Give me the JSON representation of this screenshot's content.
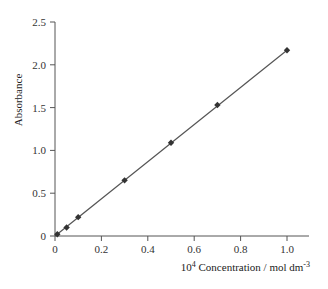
{
  "chart_data": {
    "type": "scatter",
    "title": "",
    "xlabel": "10^4 Concentration / mol dm^-3",
    "xlabel_parts": {
      "prefix": "10",
      "exp": "4",
      "main": " Concentration / mol dm",
      "unit_exp": "-3"
    },
    "ylabel": "Absorbance",
    "xlim": [
      0,
      1.1
    ],
    "ylim": [
      0,
      2.5
    ],
    "x_ticks": [
      0,
      0.2,
      0.4,
      0.6,
      0.8,
      1.0
    ],
    "x_tick_labels": [
      "0",
      "0.2",
      "0.4",
      "0.6",
      "0.8",
      "1.0"
    ],
    "y_ticks": [
      0,
      0.5,
      1.0,
      1.5,
      2.0,
      2.5
    ],
    "y_tick_labels": [
      "0",
      "0.5",
      "1.0",
      "1.5",
      "2.0",
      "2.5"
    ],
    "grid": false,
    "legend": null,
    "series": [
      {
        "name": "data",
        "marker": "diamond",
        "color": "#333333",
        "x": [
          0.01,
          0.05,
          0.1,
          0.3,
          0.5,
          0.7,
          1.0
        ],
        "y": [
          0.02,
          0.1,
          0.22,
          0.65,
          1.09,
          1.53,
          2.17
        ]
      },
      {
        "name": "fit",
        "type": "line",
        "color": "#555555",
        "x": [
          0,
          1.0
        ],
        "y": [
          0,
          2.17
        ]
      }
    ]
  }
}
